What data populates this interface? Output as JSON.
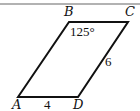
{
  "figure": {
    "shape": "parallelogram",
    "vertices": {
      "A": {
        "label": "A",
        "x": 18,
        "y": 97
      },
      "B": {
        "label": "B",
        "x": 69,
        "y": 22
      },
      "C": {
        "label": "C",
        "x": 128,
        "y": 22
      },
      "D": {
        "label": "D",
        "x": 78,
        "y": 97
      }
    },
    "angle_B": "125°",
    "side_AD": "4",
    "side_CD": "6",
    "stroke_color": "#111111",
    "top_rule_color": "#555555"
  }
}
